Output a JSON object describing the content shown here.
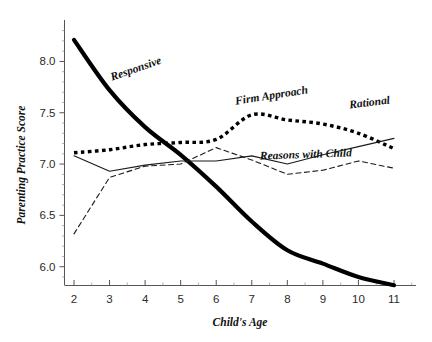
{
  "chart_data": {
    "type": "line",
    "title": "",
    "subtitle": "",
    "xlabel": "Child's Age",
    "ylabel": "Parenting Practice Score",
    "xlim": [
      1.5,
      11.5
    ],
    "ylim": [
      5.7,
      8.35
    ],
    "xticks": [
      2,
      3,
      4,
      5,
      6,
      7,
      8,
      9,
      10,
      11
    ],
    "xtick_labels": [
      "2",
      "3",
      "4",
      "5",
      "6",
      "7",
      "8",
      "9",
      "10",
      "11"
    ],
    "yticks": [
      6.0,
      6.5,
      7.0,
      7.5,
      8.0
    ],
    "ytick_labels": [
      "6.0",
      "6.5",
      "7.0",
      "7.5",
      "8.0"
    ],
    "y_minor_tick_step": 0.1,
    "grid": false,
    "legend_position": "inline-annotations",
    "x": [
      2,
      3,
      4,
      5,
      6,
      7,
      8,
      9,
      10,
      11
    ],
    "series": [
      {
        "name": "Responsive",
        "style": "thick-solid",
        "color": "#000000",
        "line_width": 4.2,
        "values": [
          8.21,
          7.72,
          7.36,
          7.09,
          6.78,
          6.44,
          6.16,
          6.03,
          5.9,
          5.82
        ],
        "label_text": "Responsive",
        "label_x": 137,
        "label_y": 72,
        "label_rotation": -19
      },
      {
        "name": "Firm Approach",
        "style": "thick-dotted",
        "color": "#000000",
        "line_width": 3.4,
        "values": [
          7.11,
          7.14,
          7.19,
          7.21,
          7.24,
          7.48,
          7.43,
          7.39,
          7.3,
          7.15
        ],
        "label_text": "Firm Approach",
        "label_x": 272,
        "label_y": 99,
        "label_rotation": -9
      },
      {
        "name": "Rational",
        "style": "thin-solid",
        "color": "#1a1a1a",
        "line_width": 1.1,
        "values": [
          7.08,
          6.93,
          6.99,
          7.03,
          7.03,
          7.08,
          7.0,
          7.09,
          7.17,
          7.25
        ],
        "label_text": "Rational",
        "label_x": 370,
        "label_y": 106,
        "label_rotation": -7
      },
      {
        "name": "Reasons with Child",
        "style": "thin-dashed",
        "color": "#1a1a1a",
        "line_width": 1.1,
        "values": [
          6.32,
          6.87,
          6.98,
          7.0,
          7.16,
          7.04,
          6.9,
          6.94,
          7.03,
          6.96
        ],
        "label_text": "Reasons with Child",
        "label_x": 306,
        "label_y": 158,
        "label_rotation": -2
      }
    ]
  },
  "axes": {
    "x_axis_name": "child-age-axis",
    "y_axis_name": "parenting-practice-score-axis"
  }
}
